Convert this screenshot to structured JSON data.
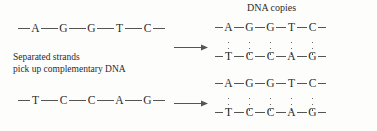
{
  "figure": {
    "title": "DNA copies",
    "caption_line1": "Separated strands",
    "caption_line2": "pick up complementary DNA",
    "colors": {
      "background": "#fdfdfc",
      "ink": "#2b2b2b",
      "line": "#555555",
      "dot": "#3a3a3a"
    }
  },
  "left_strands": [
    {
      "name": "template-strand-top",
      "bases": [
        "A",
        "G",
        "G",
        "T",
        "C"
      ]
    },
    {
      "name": "template-strand-bottom",
      "bases": [
        "T",
        "C",
        "C",
        "A",
        "G"
      ]
    }
  ],
  "arrows": [
    {
      "label": "arrow-top",
      "direction": "right"
    },
    {
      "label": "arrow-bottom",
      "direction": "right"
    }
  ],
  "duplexes": [
    {
      "name": "dna-copy-top",
      "top_bases": [
        "A",
        "G",
        "G",
        "T",
        "C"
      ],
      "bottom_bases": [
        "T",
        "C",
        "C",
        "A",
        "G"
      ],
      "hydrogen_bonds_per_pair": 3,
      "pair_count": 5
    },
    {
      "name": "dna-copy-bottom",
      "top_bases": [
        "A",
        "G",
        "G",
        "T",
        "C"
      ],
      "bottom_bases": [
        "T",
        "C",
        "C",
        "A",
        "G"
      ],
      "hydrogen_bonds_per_pair": 3,
      "pair_count": 5
    }
  ]
}
